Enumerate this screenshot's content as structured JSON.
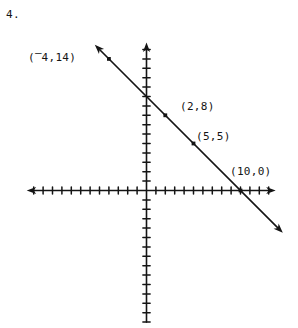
{
  "problem": {
    "number": "4."
  },
  "figure": {
    "kind": "coordinate-plane-line-graph",
    "ink_color": "#141414",
    "background_color": "#ffffff"
  },
  "labels": {
    "point_a_open": "(",
    "point_a_neg": "‒",
    "point_a_rest": "4,14)",
    "point_a_full": "(⁻4,14)",
    "point_b": "(2,8)",
    "point_c": "(5,5)",
    "point_d": "(10,0)"
  },
  "chart_data": {
    "type": "line",
    "title": "",
    "xlabel": "",
    "ylabel": "",
    "xlim": [
      -12,
      16
    ],
    "ylim": [
      -15,
      15
    ],
    "grid": false,
    "legend": null,
    "axes": {
      "x_axis": {
        "ticks_visible": true,
        "tick_interval": 1,
        "arrow_left": true,
        "arrow_right": true,
        "tick_count_left": 12,
        "tick_count_right": 13
      },
      "y_axis": {
        "ticks_visible": true,
        "tick_interval": 1,
        "arrow_up": true,
        "arrow_down": false,
        "tick_count_up": 15,
        "tick_count_down": 14
      },
      "origin_label": ""
    },
    "series": [
      {
        "name": "line",
        "equation": "y = -x + 10",
        "slope": -1,
        "intercept": 10,
        "arrow_start": true,
        "arrow_end": true,
        "x": [
          -5.5,
          14.5
        ],
        "y": [
          15.5,
          -4.5
        ],
        "points": [
          {
            "label": "(⁻4,14)",
            "x": -4,
            "y": 14,
            "marked": true
          },
          {
            "label": "(2,8)",
            "x": 2,
            "y": 8,
            "marked": true
          },
          {
            "label": "(5,5)",
            "x": 5,
            "y": 5,
            "marked": true
          },
          {
            "label": "(10,0)",
            "x": 10,
            "y": 0,
            "marked": true
          }
        ]
      }
    ]
  }
}
